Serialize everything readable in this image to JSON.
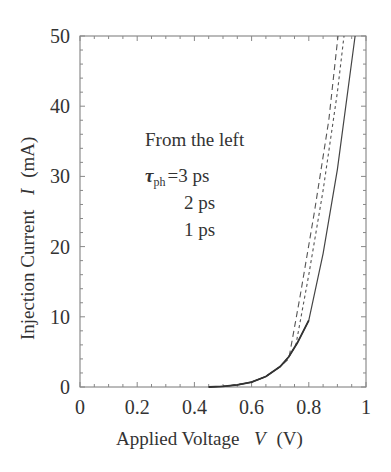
{
  "chart_data": {
    "type": "line",
    "title": "",
    "xlabel": "Applied Voltage  V (V)",
    "ylabel": "Injection Current  I (mA)",
    "xlim": [
      0,
      1
    ],
    "ylim": [
      0,
      50
    ],
    "xticks": [
      "0",
      "0.2",
      "0.4",
      "0.6",
      "0.8",
      "1"
    ],
    "yticks": [
      "0",
      "10",
      "20",
      "30",
      "40",
      "50"
    ],
    "grid": false,
    "legend": null,
    "annotations": [
      "From the left",
      "τph =3 ps",
      "2 ps",
      "1 ps"
    ],
    "series": [
      {
        "name": "τph = 3 ps",
        "style": "dashed",
        "x": [
          0.45,
          0.5,
          0.55,
          0.6,
          0.65,
          0.7,
          0.73,
          0.77,
          0.82,
          0.87,
          0.902
        ],
        "y": [
          0.0,
          0.1,
          0.3,
          0.7,
          1.5,
          2.9,
          4.0,
          13.0,
          25.0,
          38.0,
          50.0
        ]
      },
      {
        "name": "τph = 2 ps",
        "style": "dotted",
        "x": [
          0.45,
          0.5,
          0.55,
          0.6,
          0.65,
          0.7,
          0.73,
          0.755,
          0.8,
          0.85,
          0.9,
          0.923
        ],
        "y": [
          0.0,
          0.1,
          0.3,
          0.7,
          1.5,
          2.9,
          4.3,
          6.0,
          16.0,
          28.0,
          42.0,
          50.0
        ]
      },
      {
        "name": "τph = 1 ps",
        "style": "solid",
        "x": [
          0.45,
          0.5,
          0.55,
          0.6,
          0.65,
          0.7,
          0.73,
          0.76,
          0.8,
          0.85,
          0.9,
          0.962
        ],
        "y": [
          0.0,
          0.1,
          0.3,
          0.7,
          1.5,
          2.9,
          4.3,
          6.3,
          9.5,
          19.0,
          31.0,
          50.0
        ]
      }
    ]
  },
  "labels": {
    "xlabel_text": "Applied Voltage",
    "xlabel_var": "V",
    "xlabel_unit": "(V)",
    "ylabel_text": "Injection Current",
    "ylabel_var": "I",
    "ylabel_unit": "(mA)",
    "annot_line1": "From the left",
    "annot_tau": "τ",
    "annot_sub": "ph",
    "annot_first": "=3  ps",
    "annot_line3": "2  ps",
    "annot_line4": "1  ps"
  }
}
